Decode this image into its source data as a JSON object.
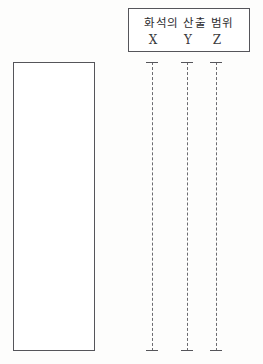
{
  "figure": {
    "background_color": "#fdfdfc",
    "line_color": "#6b6b70",
    "border_color": "#55555a"
  },
  "strata_column": {
    "name": "strata-column",
    "label": "",
    "left": 13,
    "top": 62,
    "width": 82,
    "height": 289
  },
  "legend": {
    "title": "화석의 산출 범위",
    "letters": [
      {
        "label": "X",
        "x": 24
      },
      {
        "label": "Y",
        "x": 59
      },
      {
        "label": "Z",
        "x": 88
      }
    ]
  },
  "ranges": [
    {
      "name": "X",
      "x": 152,
      "top": 62,
      "bottom": 351
    },
    {
      "name": "Y",
      "x": 187,
      "top": 62,
      "bottom": 351
    },
    {
      "name": "Z",
      "x": 216,
      "top": 62,
      "bottom": 351
    }
  ]
}
